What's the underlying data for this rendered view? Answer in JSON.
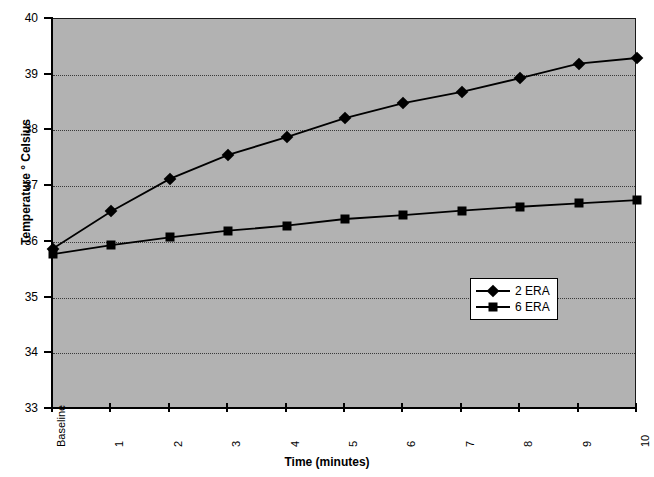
{
  "chart_data": {
    "type": "line",
    "title": "",
    "xlabel": "Time (minutes)",
    "ylabel": "Temperature ° Celsius",
    "categories": [
      "Baseline",
      "1",
      "2",
      "3",
      "4",
      "5",
      "6",
      "7",
      "8",
      "9",
      "10"
    ],
    "ylim": [
      33,
      40
    ],
    "yticks": [
      33,
      34,
      35,
      36,
      37,
      38,
      39,
      40
    ],
    "ytick_labels": [
      "33",
      "34",
      "35",
      "36",
      "37",
      "38",
      "39",
      "40"
    ],
    "grid": true,
    "grid_style": "dotted-horizontal",
    "legend_position": "center-right",
    "plot_background": "#b2b2b2",
    "series": [
      {
        "name": "2 ERA",
        "marker": "diamond",
        "color": "#000000",
        "values": [
          35.88,
          36.55,
          37.13,
          37.56,
          37.88,
          38.22,
          38.49,
          38.69,
          38.94,
          39.2,
          39.3
        ]
      },
      {
        "name": "6 ERA",
        "marker": "square",
        "color": "#000000",
        "values": [
          35.78,
          35.94,
          36.08,
          36.2,
          36.29,
          36.41,
          36.48,
          36.56,
          36.63,
          36.69,
          36.75
        ]
      }
    ]
  },
  "legend": {
    "entries": [
      {
        "label": "2 ERA",
        "marker": "diamond"
      },
      {
        "label": "6 ERA",
        "marker": "square"
      }
    ]
  }
}
